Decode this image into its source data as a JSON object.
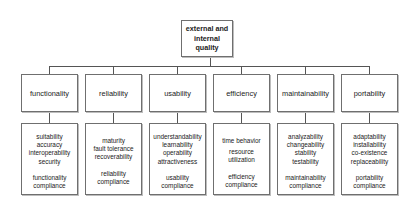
{
  "root": {
    "lines": [
      "external and",
      "internal",
      "quality"
    ]
  },
  "categories": [
    {
      "label": "functionality",
      "subcharacteristics": [
        "suitability",
        "accuracy",
        "interoperability",
        "security"
      ],
      "compliance": [
        "functionality",
        "compliance"
      ]
    },
    {
      "label": "reliability",
      "subcharacteristics": [
        "maturity",
        "fault tolerance",
        "recoverability"
      ],
      "compliance": [
        "reliability",
        "compliance"
      ]
    },
    {
      "label": "usability",
      "subcharacteristics": [
        "understandability",
        "learnability",
        "operability",
        "attractiveness"
      ],
      "compliance": [
        "usability",
        "compliance"
      ]
    },
    {
      "label": "efficiency",
      "subcharacteristics": [
        "time behavior",
        "resource",
        "utilization"
      ],
      "compliance": [
        "efficiency",
        "compliance"
      ]
    },
    {
      "label": "maintainability",
      "subcharacteristics": [
        "analyzability",
        "changeability",
        "stability",
        "testability"
      ],
      "compliance": [
        "maintainability",
        "compliance"
      ]
    },
    {
      "label": "portability",
      "subcharacteristics": [
        "adaptability",
        "installability",
        "co-existence",
        "replaceability"
      ],
      "compliance": [
        "portability",
        "compliance"
      ]
    }
  ]
}
